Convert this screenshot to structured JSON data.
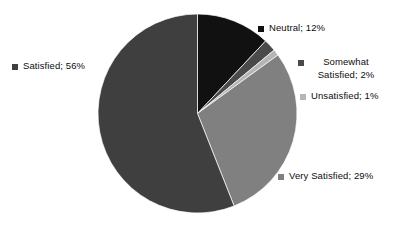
{
  "chart_data": {
    "type": "pie",
    "title": "",
    "subtitle": "",
    "xlabel": "",
    "ylabel": "",
    "legend_position": "none",
    "grid": false,
    "labels_show_percent": true,
    "start_angle_deg": 0,
    "direction": "clockwise",
    "categories": [
      "Neutral",
      "Somewhat Satisfied",
      "Unsatisfied",
      "Very Satisfied",
      "Satisfied"
    ],
    "values": [
      12,
      2,
      1,
      29,
      56
    ],
    "value_unit": "%",
    "colors": [
      "#111111",
      "#4a4a4a",
      "#b5b5b5",
      "#808080",
      "#3f3f3f"
    ],
    "slices": [
      {
        "name": "Neutral",
        "value": 12,
        "label": "Neutral; 12%",
        "color": "#111111",
        "start_deg": 0,
        "end_deg": 43.2
      },
      {
        "name": "Somewhat Satisfied",
        "value": 2,
        "label_line1": "Somewhat",
        "label_line2": "Satisfied; 2%",
        "label": "Somewhat Satisfied; 2%",
        "color": "#4a4a4a",
        "start_deg": 43.2,
        "end_deg": 50.4
      },
      {
        "name": "Unsatisfied",
        "value": 1,
        "label": "Unsatisfied; 1%",
        "color": "#b5b5b5",
        "start_deg": 50.4,
        "end_deg": 54.0
      },
      {
        "name": "Very Satisfied",
        "value": 29,
        "label": "Very Satisfied; 29%",
        "color": "#808080",
        "start_deg": 54.0,
        "end_deg": 158.4
      },
      {
        "name": "Satisfied",
        "value": 56,
        "label": "Satisfied; 56%",
        "color": "#3f3f3f",
        "start_deg": 158.4,
        "end_deg": 360.0
      }
    ],
    "geometry": {
      "center_x": 197.5,
      "center_y": 113.5,
      "radius": 99.5
    },
    "background_color": "#ffffff",
    "text_color": "#0d0d0d"
  }
}
